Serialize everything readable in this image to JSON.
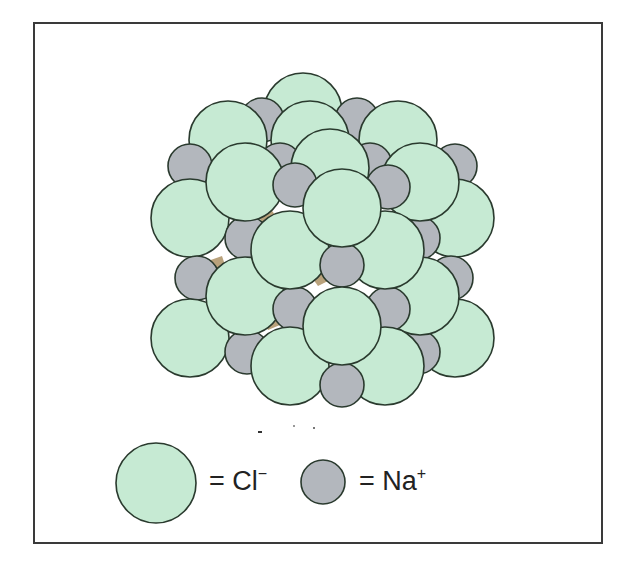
{
  "figure": {
    "colors": {
      "chloride": "#c6ead3",
      "sodium": "#b3b7bd",
      "gap": "#b9a27c",
      "outline": "#2a3a2e",
      "frame": "#3a3a3a"
    }
  },
  "legend": {
    "items": [
      {
        "symbol": "Cl",
        "charge": "−",
        "label": "= Cl",
        "ion": "chloride"
      },
      {
        "symbol": "Na",
        "charge": "+",
        "label": "= Na",
        "ion": "sodium"
      }
    ]
  }
}
